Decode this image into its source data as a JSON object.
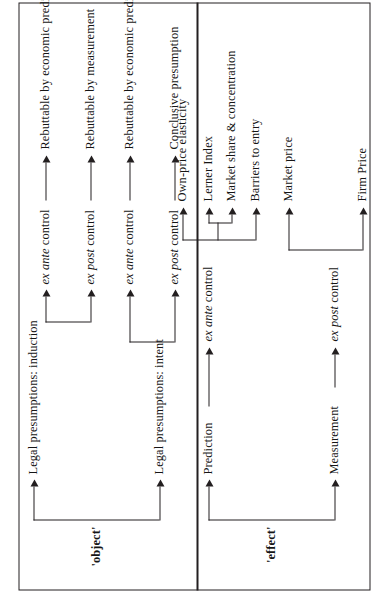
{
  "figure": {
    "type": "tree-diagram",
    "orientation": "rotated-90-ccw",
    "panels": [
      {
        "id": "object",
        "root_label": "'object'",
        "branches": [
          {
            "label": "Legal presumptions: induction",
            "children": [
              {
                "stage": "ex ante control",
                "stage_italic": "ex ante",
                "stage_roman": "control",
                "outcome": "Rebuttable by economic prediction"
              },
              {
                "stage": "ex post control",
                "stage_italic": "ex post",
                "stage_roman": "control",
                "outcome": "Rebuttable by measurement"
              }
            ]
          },
          {
            "label": "Legal presumptions: intent",
            "children": [
              {
                "stage": "ex ante control",
                "stage_italic": "ex ante",
                "stage_roman": "control",
                "outcome": "Rebuttable by economic prediction?"
              },
              {
                "stage": "ex post control",
                "stage_italic": "ex post",
                "stage_roman": "control",
                "outcome": "Conclusive presumption"
              }
            ]
          }
        ]
      },
      {
        "id": "effect",
        "root_label": "'effect'",
        "branches": [
          {
            "label": "Prediction",
            "children": [
              {
                "stage": "ex ante control",
                "stage_italic": "ex ante",
                "stage_roman": "control",
                "outcomes": [
                  "Own-price elasticity",
                  "Lerner Index",
                  "Market share & concentration",
                  "Barriers to entry"
                ],
                "subgroup": [
                  "Lerner Index",
                  "Market share & concentration"
                ]
              }
            ]
          },
          {
            "label": "Measurement",
            "children": [
              {
                "stage": "ex post control",
                "stage_italic": "ex post",
                "stage_roman": "control",
                "outcomes": [
                  "Market price",
                  "Firm Price"
                ]
              }
            ]
          }
        ]
      }
    ]
  },
  "labels": {
    "object_root": "'object'",
    "effect_root": "'effect'",
    "legal_induction": "Legal presumptions: induction",
    "legal_intent": "Legal presumptions: intent",
    "prediction": "Prediction",
    "measurement": "Measurement",
    "ex_ante_i": "ex ante",
    "ex_post_i": "ex post",
    "control": "control",
    "o1": "Rebuttable by economic prediction",
    "o2": "Rebuttable by measurement",
    "o3": "Rebuttable by economic prediction?",
    "o4": "Conclusive presumption",
    "e1": "Own-price elasticity",
    "e2": "Lerner Index",
    "e3": "Market share & concentration",
    "e4": "Barriers to entry",
    "e5": "Market price",
    "e6": "Firm Price"
  },
  "colors": {
    "ink": "#231f20",
    "background": "#ffffff"
  }
}
